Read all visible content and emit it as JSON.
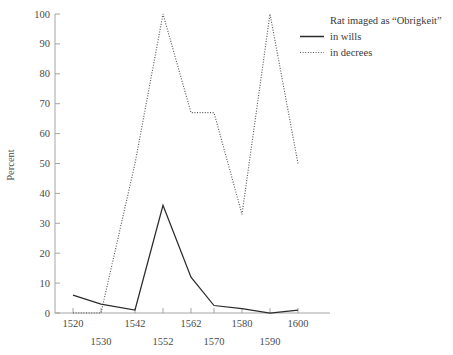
{
  "chart_data": {
    "type": "line",
    "title": "",
    "xlabel": "",
    "ylabel": "Percent",
    "xlim": [
      1520,
      1600
    ],
    "ylim": [
      0,
      100
    ],
    "grid": false,
    "legend_position": "top-right",
    "legend_title": "Rat imaged as “Obrigkeit”",
    "x_tick_labels_upper": [
      "1520",
      "1542",
      "1562",
      "1580",
      "1600"
    ],
    "x_tick_labels_lower": [
      "1530",
      "1552",
      "1570",
      "1590"
    ],
    "x_tick_values": [
      1520,
      1530,
      1542,
      1552,
      1562,
      1570,
      1580,
      1590,
      1600
    ],
    "y_tick_labels": [
      "0",
      "10",
      "20",
      "30",
      "40",
      "50",
      "60",
      "70",
      "80",
      "90",
      "100"
    ],
    "y_tick_values": [
      0,
      10,
      20,
      30,
      40,
      50,
      60,
      70,
      80,
      90,
      100
    ],
    "x": [
      1520,
      1530,
      1542,
      1552,
      1562,
      1570,
      1580,
      1590,
      1600
    ],
    "series": [
      {
        "name": "in wills",
        "style": "solid",
        "color": "#2b2b2b",
        "values": [
          6,
          3,
          1,
          36,
          12,
          2.5,
          1.5,
          0,
          1
        ]
      },
      {
        "name": "in decrees",
        "style": "dotted",
        "color": "#555555",
        "values": [
          0,
          0,
          50,
          100,
          67,
          67,
          33,
          100,
          50
        ]
      }
    ]
  },
  "legend": {
    "title": "Rat imaged as “Obrigkeit”",
    "entries": [
      {
        "label": "in wills",
        "style": "solid"
      },
      {
        "label": "in decrees",
        "style": "dotted"
      }
    ]
  },
  "axes": {
    "y_title": "Percent"
  }
}
